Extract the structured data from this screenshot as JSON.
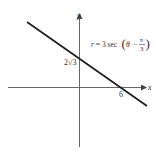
{
  "figure": {
    "number_label": "",
    "equation": {
      "lhs": "r = 3 sec",
      "theta": "θ",
      "minus": "−",
      "pi": "π",
      "denominator": "3"
    },
    "axes": {
      "x_label": "x",
      "y_label": "y"
    },
    "intercepts": {
      "y_intercept_label": "2√3",
      "x_intercept_label": "6"
    },
    "colors": {
      "line": "#1a1a1a",
      "axis": "#555555",
      "text": "#333333"
    }
  }
}
